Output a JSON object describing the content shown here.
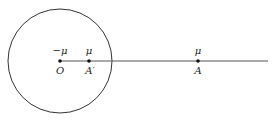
{
  "diagram": {
    "circle": {
      "cx": 60,
      "cy": 61,
      "r": 52
    },
    "ray": {
      "x1": 60,
      "y1": 61,
      "x2": 268,
      "y2": 61
    },
    "points": [
      {
        "name": "O",
        "x": 60,
        "y": 61,
        "label": "O",
        "charge": "−μ"
      },
      {
        "name": "A-prime",
        "x": 89,
        "y": 61,
        "label": "A′",
        "charge": "μ"
      },
      {
        "name": "A",
        "x": 198,
        "y": 61,
        "label": "A",
        "charge": "μ"
      }
    ]
  }
}
